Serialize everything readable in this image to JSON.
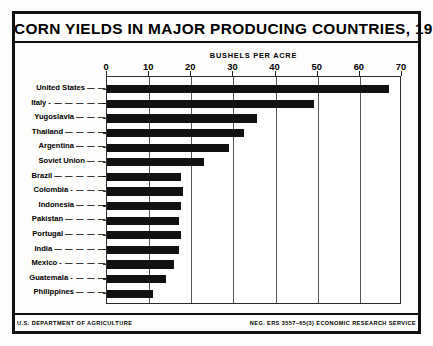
{
  "chart_data": {
    "type": "bar",
    "orientation": "horizontal",
    "title": "CORN YIELDS IN MAJOR PRODUCING COUNTRIES, 1963",
    "xlabel": "BUSHELS PER ACRE",
    "ylabel": "",
    "xlim": [
      0,
      70
    ],
    "xticks": [
      0,
      10,
      20,
      30,
      40,
      50,
      60,
      70
    ],
    "grid": true,
    "legend": "none",
    "categories": [
      "United States",
      "Italy",
      "Yugoslavia",
      "Thailand",
      "Argentina",
      "Soviet Union",
      "Brazil",
      "Colombia",
      "Indonesia",
      "Pakistan",
      "Portugal",
      "India",
      "Mexico",
      "Guatemala",
      "Philippines"
    ],
    "values": [
      67,
      49,
      35.5,
      32.5,
      29,
      23,
      17.5,
      18,
      17.5,
      17,
      17.5,
      17,
      16,
      14,
      11
    ],
    "bar_color": "#111111"
  },
  "footer": {
    "left": "U.S. DEPARTMENT OF AGRICULTURE",
    "right": "NEG. ERS 3557–65(3) ECONOMIC RESEARCH SERVICE"
  },
  "label_dashes": [
    "— —",
    "- — — — — —",
    "— — —",
    "— — — —",
    "— — —",
    "— —",
    "— — — — —",
    "- — — —",
    "— — —",
    "— — — —",
    "— — — —",
    "— — — — —",
    "- — — — —",
    "- — — —",
    "— — —"
  ]
}
